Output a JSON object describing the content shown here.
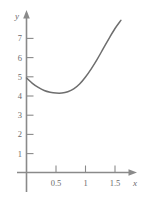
{
  "chart_data": {
    "type": "line",
    "title": "",
    "subtitle": "",
    "xlabel": "x",
    "ylabel": "y",
    "xlim": [
      0,
      1.75
    ],
    "ylim": [
      0,
      8.1
    ],
    "grid": false,
    "legend": null,
    "x_ticks": [
      {
        "value": 0.5,
        "label": "0.5"
      },
      {
        "value": 1,
        "label": "1"
      },
      {
        "value": 1.5,
        "label": "1.5"
      }
    ],
    "y_ticks": [
      {
        "value": 1,
        "label": "1"
      },
      {
        "value": 2,
        "label": "2"
      },
      {
        "value": 3,
        "label": "3"
      },
      {
        "value": 4,
        "label": "4"
      },
      {
        "value": 5,
        "label": "5"
      },
      {
        "value": 6,
        "label": "6"
      },
      {
        "value": 7,
        "label": "7"
      }
    ],
    "series": [
      {
        "name": "curve",
        "color": "#6e6e6e",
        "points": [
          {
            "x": 0.0,
            "y": 5.0
          },
          {
            "x": 0.1,
            "y": 4.72
          },
          {
            "x": 0.2,
            "y": 4.5
          },
          {
            "x": 0.3,
            "y": 4.34
          },
          {
            "x": 0.4,
            "y": 4.25
          },
          {
            "x": 0.5,
            "y": 4.2
          },
          {
            "x": 0.6,
            "y": 4.2
          },
          {
            "x": 0.7,
            "y": 4.27
          },
          {
            "x": 0.8,
            "y": 4.42
          },
          {
            "x": 0.9,
            "y": 4.68
          },
          {
            "x": 1.0,
            "y": 5.05
          },
          {
            "x": 1.1,
            "y": 5.5
          },
          {
            "x": 1.2,
            "y": 6.0
          },
          {
            "x": 1.3,
            "y": 6.55
          },
          {
            "x": 1.4,
            "y": 7.1
          },
          {
            "x": 1.5,
            "y": 7.62
          },
          {
            "x": 1.6,
            "y": 8.05
          }
        ]
      }
    ],
    "annotations": {
      "minimum_approx": {
        "x": 0.6,
        "y": 4.2
      },
      "y_intercept": {
        "x": 0,
        "y": 5.0
      }
    },
    "colors": {
      "axis": "#8a8a8a",
      "curve": "#6e6e6e",
      "label": "#6b6b6b",
      "background": "#ffffff"
    }
  }
}
